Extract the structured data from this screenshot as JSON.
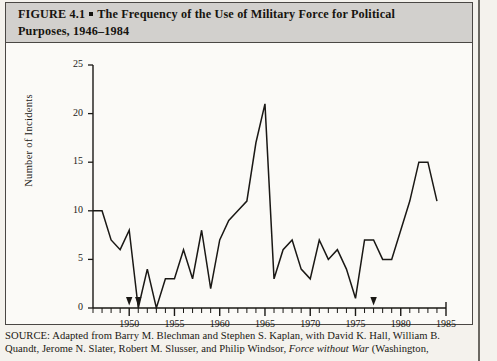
{
  "figure": {
    "label": "FIGURE 4.1",
    "title_line1": "The Frequency of the Use of Military Force for Political",
    "title_line2": "Purposes, 1946–1984"
  },
  "source": {
    "line1": "SOURCE: Adapted from Barry M. Blechman and Stephen S. Kaplan, with David K. Hall, William B.",
    "line2_pre": "Quandt, Jerome N. Slater, Robert M. Slusser, and Philip Windsor, ",
    "line2_italic": "Force without War",
    "line2_post": " (Washington,"
  },
  "chart_data": {
    "type": "line",
    "xlabel": "",
    "ylabel": "Number of Incidents",
    "xlim": [
      1946,
      1985
    ],
    "ylim": [
      0,
      25
    ],
    "yticks": [
      0,
      5,
      10,
      15,
      20,
      25
    ],
    "ytick_labels": [
      "0",
      "5",
      "10",
      "15",
      "20",
      "25"
    ],
    "xticks": [
      1950,
      1955,
      1960,
      1965,
      1970,
      1975,
      1980,
      1985
    ],
    "xtick_labels": [
      "1950",
      "1955",
      "1960",
      "1965",
      "1970",
      "1975",
      "1980",
      "1985"
    ],
    "minor_xticks_every": 1,
    "grid": false,
    "legend": null,
    "line_color": "#1a1815",
    "axis_color": "#1a1815",
    "markers_on_axis_years": [
      1950,
      1951,
      1977
    ],
    "x": [
      1946,
      1947,
      1948,
      1949,
      1950,
      1951,
      1952,
      1953,
      1954,
      1955,
      1956,
      1957,
      1958,
      1959,
      1960,
      1961,
      1962,
      1963,
      1964,
      1965,
      1966,
      1967,
      1968,
      1969,
      1970,
      1971,
      1972,
      1973,
      1974,
      1975,
      1976,
      1977,
      1978,
      1979,
      1980,
      1981,
      1982,
      1983,
      1984
    ],
    "values": [
      10,
      10,
      7,
      6,
      8,
      0,
      4,
      0,
      3,
      3,
      6,
      3,
      8,
      2,
      7,
      9,
      10,
      11,
      17,
      21,
      3,
      6,
      7,
      4,
      3,
      7,
      5,
      6,
      4,
      1,
      7,
      7,
      5,
      5,
      8,
      11,
      15,
      15,
      11
    ],
    "series": [
      {
        "name": "Incidents",
        "values": [
          10,
          10,
          7,
          6,
          8,
          0,
          4,
          0,
          3,
          3,
          6,
          3,
          8,
          2,
          7,
          9,
          10,
          11,
          17,
          21,
          3,
          6,
          7,
          4,
          3,
          7,
          5,
          6,
          4,
          1,
          7,
          7,
          5,
          5,
          8,
          11,
          15,
          15,
          11
        ]
      }
    ]
  }
}
